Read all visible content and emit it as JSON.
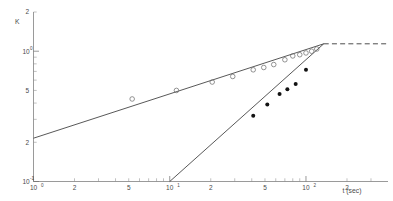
{
  "chart_data": {
    "type": "scatter",
    "title": "",
    "subtitle": "",
    "xlabel": "t (sec)",
    "ylabel": "K",
    "xscale": "log",
    "yscale": "log",
    "xlim": [
      1,
      400
    ],
    "ylim": [
      0.1,
      2
    ],
    "grid": false,
    "legend_position": "none",
    "x_ticks": [
      {
        "value": 1,
        "label": "10",
        "exponent": "0",
        "major": true
      },
      {
        "value": 2,
        "label": "2",
        "exponent": "",
        "major": false
      },
      {
        "value": 3,
        "label": "",
        "exponent": "",
        "major": false
      },
      {
        "value": 4,
        "label": "",
        "exponent": "",
        "major": false
      },
      {
        "value": 5,
        "label": "5",
        "exponent": "",
        "major": false
      },
      {
        "value": 6,
        "label": "",
        "exponent": "",
        "major": false
      },
      {
        "value": 7,
        "label": "",
        "exponent": "",
        "major": false
      },
      {
        "value": 8,
        "label": "",
        "exponent": "",
        "major": false
      },
      {
        "value": 9,
        "label": "",
        "exponent": "",
        "major": false
      },
      {
        "value": 10,
        "label": "10",
        "exponent": "1",
        "major": true
      },
      {
        "value": 20,
        "label": "2",
        "exponent": "",
        "major": false
      },
      {
        "value": 30,
        "label": "",
        "exponent": "",
        "major": false
      },
      {
        "value": 40,
        "label": "",
        "exponent": "",
        "major": false
      },
      {
        "value": 50,
        "label": "5",
        "exponent": "",
        "major": false
      },
      {
        "value": 60,
        "label": "",
        "exponent": "",
        "major": false
      },
      {
        "value": 70,
        "label": "",
        "exponent": "",
        "major": false
      },
      {
        "value": 80,
        "label": "",
        "exponent": "",
        "major": false
      },
      {
        "value": 90,
        "label": "",
        "exponent": "",
        "major": false
      },
      {
        "value": 100,
        "label": "10",
        "exponent": "2",
        "major": true
      },
      {
        "value": 200,
        "label": "2",
        "exponent": "",
        "major": false
      },
      {
        "value": 300,
        "label": "",
        "exponent": "",
        "major": false
      }
    ],
    "y_ticks": [
      {
        "value": 0.1,
        "label": "10",
        "exponent": "-1",
        "major": true
      },
      {
        "value": 0.2,
        "label": "2",
        "exponent": "",
        "major": false
      },
      {
        "value": 0.3,
        "label": "",
        "exponent": "",
        "major": false
      },
      {
        "value": 0.4,
        "label": "",
        "exponent": "",
        "major": false
      },
      {
        "value": 0.5,
        "label": "5",
        "exponent": "",
        "major": false
      },
      {
        "value": 0.6,
        "label": "",
        "exponent": "",
        "major": false
      },
      {
        "value": 0.7,
        "label": "",
        "exponent": "",
        "major": false
      },
      {
        "value": 0.8,
        "label": "",
        "exponent": "",
        "major": false
      },
      {
        "value": 0.9,
        "label": "",
        "exponent": "",
        "major": false
      },
      {
        "value": 1.0,
        "label": "10",
        "exponent": "0",
        "major": true
      },
      {
        "value": 2.0,
        "label": "2",
        "exponent": "",
        "major": false
      }
    ],
    "series": [
      {
        "name": "open-circles",
        "marker": "open-circle",
        "color": "#707070",
        "x": [
          5.3,
          11.2,
          20.5,
          29.0,
          41.0,
          49.0,
          58.0,
          70.0,
          80.0,
          90.0,
          100.0,
          110.0,
          120.0
        ],
        "y": [
          0.43,
          0.5,
          0.58,
          0.64,
          0.72,
          0.75,
          0.79,
          0.86,
          0.92,
          0.94,
          0.97,
          1.0,
          1.04
        ]
      },
      {
        "name": "filled-circles",
        "marker": "filled-circle",
        "color": "#121212",
        "x": [
          41.0,
          52.0,
          64.0,
          73.0,
          84.0,
          100.0
        ],
        "y": [
          0.32,
          0.39,
          0.47,
          0.51,
          0.56,
          0.72
        ]
      }
    ],
    "lines": [
      {
        "name": "shallow-fit-line",
        "style": "solid",
        "x": [
          1.0,
          135.0
        ],
        "y": [
          0.215,
          1.14
        ]
      },
      {
        "name": "steep-fit-line",
        "style": "solid",
        "x": [
          10.0,
          135.0
        ],
        "y": [
          0.1,
          1.14
        ]
      },
      {
        "name": "plateau-dashed-line",
        "style": "dashed",
        "x": [
          135.0,
          400.0
        ],
        "y": [
          1.14,
          1.14
        ]
      }
    ],
    "annotations": []
  }
}
